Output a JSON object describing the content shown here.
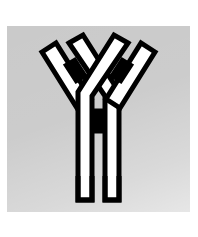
{
  "figure": {
    "title": "Antibody (immunoglobulin) schematic",
    "background_color": "#c9c9c9",
    "page_color": "#ffffff",
    "stroke_color": "#000000",
    "fill_color": "#ffffff",
    "accent_color": "#000000"
  },
  "plate": {
    "x": 7,
    "y": 26,
    "width": 183,
    "height": 186
  },
  "structure": {
    "shape": "Y",
    "parts": [
      {
        "name": "heavy-chain-left",
        "label": "Heavy chain (left)",
        "fill": "#ffffff",
        "stroke": "#000000"
      },
      {
        "name": "heavy-chain-right",
        "label": "Heavy chain (right)",
        "fill": "#ffffff",
        "stroke": "#000000"
      },
      {
        "name": "light-chain-left",
        "label": "Light chain (left)",
        "fill": "#ffffff",
        "stroke": "#000000"
      },
      {
        "name": "light-chain-right",
        "label": "Light chain (right)",
        "fill": "#ffffff",
        "stroke": "#000000"
      },
      {
        "name": "disulfide-bond-left",
        "label": "Disulfide bond (left arm)",
        "fill": "#000000"
      },
      {
        "name": "disulfide-bond-right",
        "label": "Disulfide bond (right arm)",
        "fill": "#000000"
      },
      {
        "name": "disulfide-bond-hinge",
        "label": "Disulfide bond (hinge)",
        "fill": "#000000"
      },
      {
        "name": "fc-stem-left",
        "label": "Fc stem (left)",
        "fill": "#ffffff",
        "stroke": "#000000"
      },
      {
        "name": "fc-stem-right",
        "label": "Fc stem (right)",
        "fill": "#ffffff",
        "stroke": "#000000"
      }
    ]
  },
  "geometry": {
    "stroke_width": 5,
    "arm_angle_degrees": 38,
    "stem_gap": 6
  }
}
